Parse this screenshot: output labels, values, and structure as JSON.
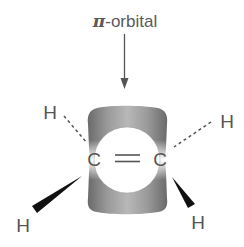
{
  "diagram": {
    "title_label": {
      "symbol": "π",
      "text": "-orbital"
    },
    "molecule": "ethene",
    "atoms": {
      "carbon_left": "C",
      "carbon_right": "C",
      "h_top_left": "H",
      "h_top_right": "H",
      "h_bottom_left": "H",
      "h_bottom_right": "H"
    },
    "bonds": {
      "c_c": "double",
      "h_top_left": "dashed",
      "h_top_right": "dashed",
      "h_bottom_left": "wedge",
      "h_bottom_right": "wedge"
    },
    "colors": {
      "text": "#5a5a5a",
      "orbital_dark": "#6e6e6e",
      "orbital_light": "#bdbdbd",
      "wedge": "#111111",
      "arrow": "#555555"
    }
  }
}
